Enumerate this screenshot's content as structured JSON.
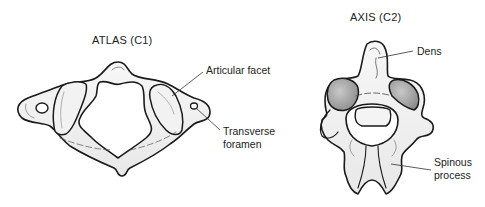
{
  "diagram": {
    "atlas": {
      "title": "ATLAS (C1)",
      "labels": {
        "articular_facet": "Articular facet",
        "transverse_foramen_line1": "Transverse",
        "transverse_foramen_line2": "foramen"
      }
    },
    "axis": {
      "title": "AXIS (C2)",
      "labels": {
        "dens": "Dens",
        "spinous_process_line1": "Spinous",
        "spinous_process_line2": "process"
      }
    },
    "colors": {
      "outline": "#1a1a1a",
      "bone_fill": "#f4f4f4",
      "shade": "#bdbdbd",
      "facet_dark": "#8f8f8f"
    }
  }
}
